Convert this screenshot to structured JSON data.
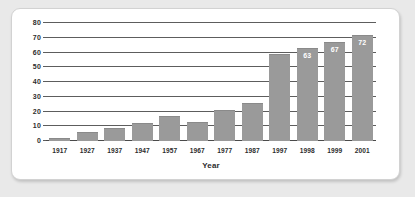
{
  "chart_data": {
    "type": "bar",
    "title": "",
    "subtitle": "",
    "xlabel": "Year",
    "ylabel": "",
    "categories": [
      "1917",
      "1927",
      "1937",
      "1947",
      "1957",
      "1967",
      "1977",
      "1987",
      "1997",
      "1998",
      "1999",
      "2001"
    ],
    "values": [
      2,
      6,
      9,
      12,
      17,
      13,
      21,
      26,
      59,
      63,
      67,
      72
    ],
    "point_labels": [
      "",
      "",
      "",
      "",
      "",
      "",
      "",
      "",
      "",
      "63",
      "67",
      "72"
    ],
    "ylim": [
      0,
      80
    ],
    "ytick_labels": [
      "0",
      "10",
      "20",
      "30",
      "40",
      "50",
      "60",
      "70",
      "80"
    ],
    "ytick_values": [
      0,
      10,
      20,
      30,
      40,
      50,
      60,
      70,
      80
    ],
    "grid": true,
    "grid_axis": "y",
    "legend": false,
    "legend_position": "none",
    "series": [
      {
        "name": "",
        "values": [
          2,
          6,
          9,
          12,
          17,
          13,
          21,
          26,
          59,
          63,
          67,
          72
        ]
      }
    ]
  },
  "colors": {
    "bar_fill": "#9a9a9a",
    "bar_edge": "#8a8a8a",
    "grid_line": "#5d5d5d",
    "axis_line": "#4a4a4a",
    "tick_text": "#2d2d2d",
    "value_label": "#ffffff",
    "card_background": "#ffffff",
    "card_border": "#d2d2d2",
    "page_background": "#e9e9e9"
  }
}
